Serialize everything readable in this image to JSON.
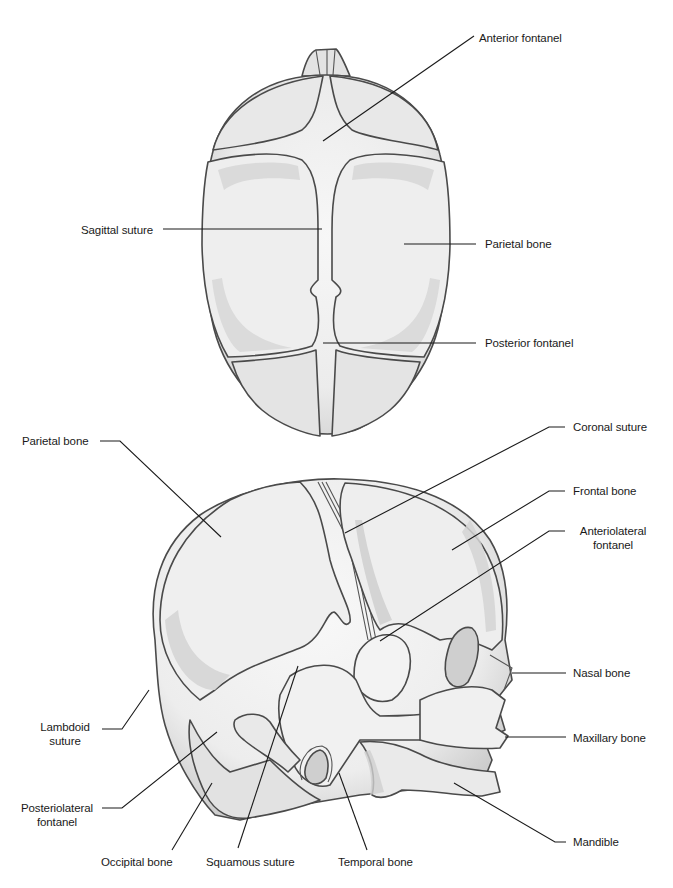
{
  "figure": {
    "colors": {
      "background": "#ffffff",
      "bone_fill": "#ececec",
      "bone_shade": "#cfcfcf",
      "bone_highlight": "#f6f6f6",
      "outline": "#4a4a4a",
      "leader_line": "#1a1a1a",
      "label_text": "#1a1a1a"
    }
  },
  "superior_view": {
    "labels": [
      {
        "id": "anterior-fontanel",
        "text": "Anterior fontanel",
        "x": 479,
        "y": 31,
        "line": "323,141 474,36"
      },
      {
        "id": "sagittal-suture",
        "text": "Sagittal suture",
        "x": 81,
        "y": 223,
        "line": "163,229 322,229"
      },
      {
        "id": "parietal-bone-top",
        "text": "Parietal bone",
        "x": 485,
        "y": 237,
        "line": "404,244 476,244"
      },
      {
        "id": "posterior-fontanel",
        "text": "Posterior fontanel",
        "x": 485,
        "y": 336,
        "line": "323,343 476,343"
      }
    ]
  },
  "lateral_view": {
    "labels": [
      {
        "id": "parietal-bone-side",
        "text": "Parietal bone",
        "x": 22,
        "y": 434,
        "line": "100,441 120,441 221,537"
      },
      {
        "id": "coronal-suture",
        "text": "Coronal suture",
        "x": 573,
        "y": 420,
        "line": "345,533 549,427 565,427"
      },
      {
        "id": "frontal-bone",
        "text": "Frontal bone",
        "x": 573,
        "y": 484,
        "line": "452,550 549,491 565,491"
      },
      {
        "id": "anteriolateral-fontanel",
        "text": "Anteriolateral\nfontanel",
        "x": 579,
        "y": 524,
        "line": "380,641 549,531 565,531"
      },
      {
        "id": "nasal-bone",
        "text": "Nasal bone",
        "x": 573,
        "y": 666,
        "line": "512,673 566,673"
      },
      {
        "id": "maxillary-bone",
        "text": "Maxillary bone",
        "x": 573,
        "y": 731,
        "line": "505,737 566,737"
      },
      {
        "id": "lambdoid-suture",
        "text": "Lambdoid\nsuture",
        "x": 42,
        "y": 720,
        "line": "102,729 122,729 149,690"
      },
      {
        "id": "posteriolateral-fontanel",
        "text": "Posteriolateral\nfontanel",
        "x": 19,
        "y": 801,
        "line": "102,808 122,808 217,732"
      },
      {
        "id": "occipital-bone",
        "text": "Occipital bone",
        "x": 140,
        "y": 855,
        "line": "172,850 212,783"
      },
      {
        "id": "squamous-suture",
        "text": "Squamous suture",
        "x": 248,
        "y": 855,
        "line": "238,848 298,666"
      },
      {
        "id": "temporal-bone",
        "text": "Temporal bone",
        "x": 374,
        "y": 855,
        "line": "367,850 339,773"
      },
      {
        "id": "mandible",
        "text": "Mandible",
        "x": 573,
        "y": 835,
        "line": "454,783 555,842 566,842"
      }
    ]
  }
}
